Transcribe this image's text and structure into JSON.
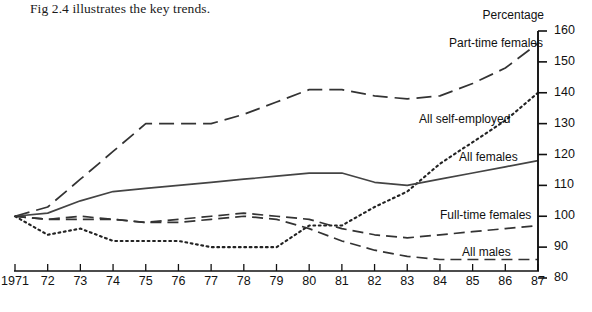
{
  "caption": "Fig 2.4 illustrates the key trends.",
  "axis": {
    "y_title": "Percentage",
    "y_ticks": [
      "160",
      "150",
      "140",
      "130",
      "120",
      "110",
      "100",
      "90",
      "80"
    ],
    "x_ticks": [
      "1971",
      "72",
      "73",
      "74",
      "75",
      "76",
      "77",
      "78",
      "79",
      "80",
      "81",
      "82",
      "83",
      "84",
      "85",
      "86",
      "87"
    ]
  },
  "series_labels": {
    "part_time_females": "Part-time females",
    "all_self_employed": "All  self-employed",
    "all_females": "All females",
    "full_time_females": "Full-time females",
    "all_males": "All males"
  },
  "chart_data": {
    "type": "line",
    "title": "",
    "subtitle": "",
    "xlabel": "",
    "ylabel": "Percentage",
    "xlim": [
      1971,
      1987
    ],
    "ylim": [
      80,
      160
    ],
    "ytick_step": 10,
    "grid": false,
    "legend": "inline-right",
    "x": [
      1971,
      1972,
      1973,
      1974,
      1975,
      1976,
      1977,
      1978,
      1979,
      1980,
      1981,
      1982,
      1983,
      1984,
      1985,
      1986,
      1987
    ],
    "series": [
      {
        "name": "Part-time females",
        "style": "long-dash",
        "color": "#333333",
        "values": [
          100,
          103,
          112,
          121,
          130,
          130,
          130,
          133,
          137,
          141,
          141,
          139,
          138,
          139,
          143,
          148,
          156
        ]
      },
      {
        "name": "All self-employed",
        "style": "dotted",
        "color": "#222222",
        "values": [
          100,
          94,
          96,
          92,
          92,
          92,
          90,
          90,
          90,
          97,
          97,
          103,
          108,
          117,
          124,
          131,
          140
        ]
      },
      {
        "name": "All females",
        "style": "solid",
        "color": "#444444",
        "values": [
          100,
          101,
          105,
          108,
          109,
          110,
          111,
          112,
          113,
          114,
          114,
          111,
          110,
          112,
          114,
          116,
          118
        ]
      },
      {
        "name": "Full-time females",
        "style": "dash",
        "color": "#333333",
        "values": [
          100,
          99,
          99,
          99,
          98,
          99,
          100,
          101,
          100,
          99,
          96,
          94,
          93,
          94,
          95,
          96,
          97
        ]
      },
      {
        "name": "All males",
        "style": "dash",
        "color": "#333333",
        "values": [
          100,
          99,
          100,
          99,
          98,
          98,
          99,
          100,
          99,
          96,
          92,
          89,
          87,
          86,
          86,
          86,
          86
        ]
      }
    ]
  }
}
